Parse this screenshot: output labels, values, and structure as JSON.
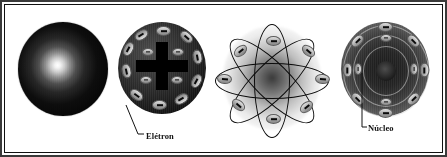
{
  "figure": {
    "background_color": "#ffffff",
    "border_color": "#111111",
    "ink_color": "#000000"
  },
  "models": [
    {
      "id": "dalton",
      "name": "modelo-dalton",
      "description": "Esfera macica uniforme",
      "electron_count": 0,
      "has_nucleus": false,
      "orbit_count": 0
    },
    {
      "id": "thomson",
      "name": "modelo-thomson",
      "description": "Pudim de passas com carga positiva central",
      "electron_count": 12,
      "has_nucleus": false,
      "orbit_count": 0,
      "charge_symbol": "+"
    },
    {
      "id": "rutherford",
      "name": "modelo-rutherford",
      "description": "Nucleo central com eletrons em orbitas elipticas",
      "electron_count": 8,
      "has_nucleus": true,
      "orbit_count": 4
    },
    {
      "id": "bohr",
      "name": "modelo-bohr",
      "description": "Nucleo com eletrons em camadas concentricas",
      "electron_count": 12,
      "has_nucleus": true,
      "orbit_count": 3
    }
  ],
  "callouts": [
    {
      "id": "eletron",
      "label": "Elétron",
      "points_to": "modelo-thomson"
    },
    {
      "id": "nucleo",
      "label": "Núcleo",
      "points_to": "modelo-bohr"
    }
  ],
  "electron_glyph": "minus-sign",
  "positive_glyph": "plus-sign"
}
